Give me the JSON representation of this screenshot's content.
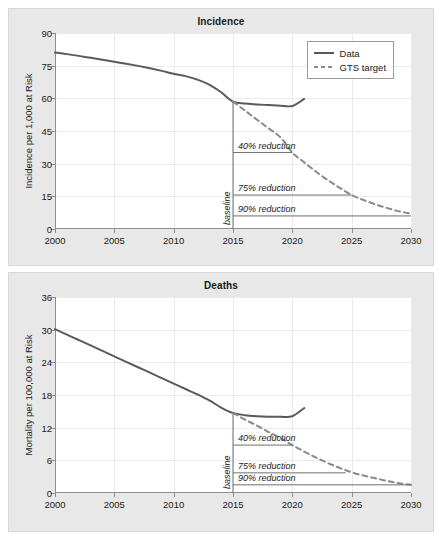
{
  "figure": {
    "background": "#ffffff",
    "panel_background": "#e8e8e8",
    "plot_background": "#ffffff",
    "line_color": "#5a5a5a",
    "target_color": "#8a8a8a",
    "axis_color": "#8d8d8d",
    "grid_color": "#ebebeb",
    "text_color": "#1a1a1a"
  },
  "chart_data": [
    {
      "type": "line",
      "id": "incidence",
      "title": "Incidence",
      "xlabel": "",
      "ylabel": "Incidence per 1,000 at Risk",
      "xlim": [
        2000,
        2030
      ],
      "ylim": [
        0,
        90
      ],
      "xticks": [
        2000,
        2005,
        2010,
        2015,
        2020,
        2025,
        2030
      ],
      "yticks": [
        0,
        15,
        30,
        45,
        60,
        75,
        90
      ],
      "grid": true,
      "legend_position": "top-right",
      "legend": [
        "Data",
        "GTS target"
      ],
      "baseline_year": 2015,
      "baseline_value": 58.5,
      "series": [
        {
          "name": "Data",
          "style": "solid",
          "x": [
            2000,
            2001,
            2002,
            2003,
            2004,
            2005,
            2006,
            2007,
            2008,
            2009,
            2010,
            2011,
            2012,
            2013,
            2014,
            2015,
            2016,
            2017,
            2018,
            2019,
            2020,
            2021
          ],
          "values": [
            81.0,
            80.3,
            79.5,
            78.6,
            77.7,
            76.8,
            75.9,
            74.9,
            73.8,
            72.6,
            71.3,
            70.2,
            68.6,
            66.3,
            62.8,
            58.5,
            57.6,
            57.2,
            56.9,
            56.6,
            56.5,
            59.7
          ]
        },
        {
          "name": "GTS target",
          "style": "dashed",
          "x": [
            2015,
            2016,
            2017,
            2018,
            2019,
            2020,
            2021,
            2022,
            2023,
            2024,
            2025,
            2026,
            2027,
            2028,
            2029,
            2030
          ],
          "values": [
            58.5,
            54.4,
            50.3,
            46.2,
            42.1,
            35.1,
            30.6,
            26.3,
            22.4,
            18.9,
            15.6,
            13.3,
            11.3,
            9.6,
            8.1,
            7.0
          ]
        }
      ],
      "reduction_lines": [
        {
          "label": "40% reduction",
          "y": 35.1,
          "x_start": 2015,
          "x_end": 2020
        },
        {
          "label": "75% reduction",
          "y": 15.6,
          "x_start": 2015,
          "x_end": 2025
        },
        {
          "label": "90% reduction",
          "y": 6.0,
          "x_start": 2015,
          "x_end": 2030
        }
      ],
      "baseline_label": "baseline"
    },
    {
      "type": "line",
      "id": "deaths",
      "title": "Deaths",
      "xlabel": "",
      "ylabel": "Mortality per 100,000 at Risk",
      "xlim": [
        2000,
        2030
      ],
      "ylim": [
        0,
        36
      ],
      "xticks": [
        2000,
        2005,
        2010,
        2015,
        2020,
        2025,
        2030
      ],
      "yticks": [
        0,
        6,
        12,
        18,
        24,
        30,
        36
      ],
      "grid": true,
      "legend_position": "none",
      "legend": [],
      "baseline_year": 2015,
      "baseline_value": 14.7,
      "series": [
        {
          "name": "Data",
          "style": "solid",
          "x": [
            2000,
            2001,
            2002,
            2003,
            2004,
            2005,
            2006,
            2007,
            2008,
            2009,
            2010,
            2011,
            2012,
            2013,
            2014,
            2015,
            2016,
            2017,
            2018,
            2019,
            2020,
            2021
          ],
          "values": [
            30.1,
            29.1,
            28.1,
            27.1,
            26.1,
            25.1,
            24.1,
            23.1,
            22.1,
            21.1,
            20.1,
            19.1,
            18.1,
            17.0,
            15.7,
            14.7,
            14.3,
            14.1,
            14.0,
            14.0,
            14.1,
            15.6
          ]
        },
        {
          "name": "GTS target",
          "style": "dashed",
          "x": [
            2015,
            2016,
            2017,
            2018,
            2019,
            2020,
            2021,
            2022,
            2023,
            2024,
            2025,
            2026,
            2027,
            2028,
            2029,
            2030
          ],
          "values": [
            14.7,
            13.5,
            12.4,
            11.2,
            10.1,
            8.8,
            7.6,
            6.5,
            5.5,
            4.6,
            3.8,
            3.2,
            2.7,
            2.2,
            1.8,
            1.5
          ]
        }
      ],
      "reduction_lines": [
        {
          "label": "40% reduction",
          "y": 8.8,
          "x_start": 2015,
          "x_end": 2020
        },
        {
          "label": "75% reduction",
          "y": 3.7,
          "x_start": 2015,
          "x_end": 2024.5
        },
        {
          "label": "90% reduction",
          "y": 1.5,
          "x_start": 2015,
          "x_end": 2030
        }
      ],
      "baseline_label": "baseline"
    }
  ]
}
